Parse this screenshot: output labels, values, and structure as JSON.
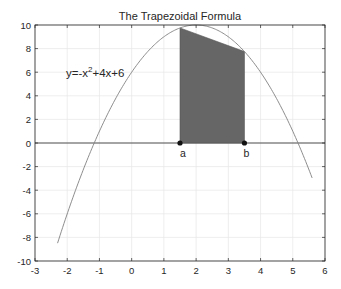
{
  "chart_data": {
    "type": "line",
    "title": "The Trapezoidal Formula",
    "xlabel": "",
    "ylabel": "",
    "xlim": [
      -3,
      6
    ],
    "ylim": [
      -10,
      10
    ],
    "grid": true,
    "xticks": [
      -3,
      -2,
      -1,
      0,
      1,
      2,
      3,
      4,
      5,
      6
    ],
    "yticks": [
      -10,
      -8,
      -6,
      -4,
      -2,
      0,
      2,
      4,
      6,
      8,
      10
    ],
    "series": [
      {
        "name": "y=-x^2+4x+6",
        "function": "-x^2+4x+6",
        "x_range": [
          -2.3,
          5.6
        ],
        "color": "#808080"
      }
    ],
    "trapezoid": {
      "a": 1.5,
      "b": 3.5,
      "fa": 9.75,
      "fb": 7.75,
      "fill": "#666666"
    },
    "annotations": [
      {
        "text": "y=-x",
        "sup": "2",
        "rest": "+4x+6",
        "x": -2.0,
        "y": 6.0
      },
      {
        "text": "a",
        "x": 1.5,
        "y": -1.0
      },
      {
        "text": "b",
        "x": 3.5,
        "y": -1.0
      }
    ]
  },
  "labels": {
    "title": "The Trapezoidal Formula",
    "eq_main": "y=-x",
    "eq_sup": "2",
    "eq_rest": "+4x+6",
    "point_a": "a",
    "point_b": "b"
  }
}
